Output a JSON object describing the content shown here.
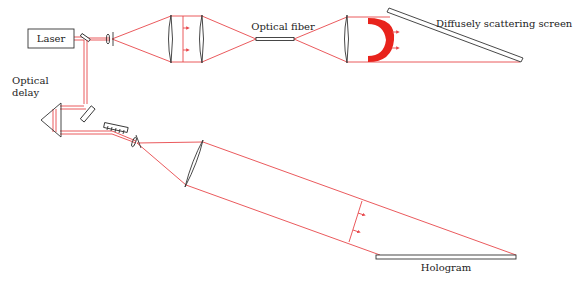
{
  "diagram": {
    "labels": {
      "laser": "Laser",
      "optical_delay_line1": "Optical",
      "optical_delay_line2": "delay",
      "optical_fiber": "Optical fiber",
      "screen": "Diffusely scattering screen",
      "hologram": "Hologram"
    },
    "colors": {
      "beam": "#e8474b",
      "object_wavefront": "#e8231c",
      "outline": "#333333",
      "background": "#ffffff"
    },
    "components": [
      {
        "id": "laser",
        "label": "Laser",
        "type": "source"
      },
      {
        "id": "beam-splitter",
        "type": "beam-splitter"
      },
      {
        "id": "spatial-filter-1",
        "type": "lens+pinhole"
      },
      {
        "id": "lens-1",
        "type": "lens"
      },
      {
        "id": "lens-2",
        "type": "lens"
      },
      {
        "id": "optical-fiber",
        "label": "Optical fiber",
        "type": "fiber"
      },
      {
        "id": "lens-3",
        "type": "lens"
      },
      {
        "id": "object-wavefront",
        "type": "wavefront"
      },
      {
        "id": "diffuse-screen",
        "label": "Diffusely scattering screen",
        "type": "screen"
      },
      {
        "id": "optical-delay",
        "label": "Optical delay",
        "type": "prism"
      },
      {
        "id": "mirror-1",
        "type": "mirror"
      },
      {
        "id": "mirror-2",
        "type": "mirror"
      },
      {
        "id": "spatial-filter-2",
        "type": "lens+pinhole"
      },
      {
        "id": "collimating-mirror",
        "type": "curved-mirror"
      },
      {
        "id": "reference-wavefront",
        "type": "wavefront"
      },
      {
        "id": "hologram",
        "label": "Hologram",
        "type": "plate"
      }
    ]
  }
}
